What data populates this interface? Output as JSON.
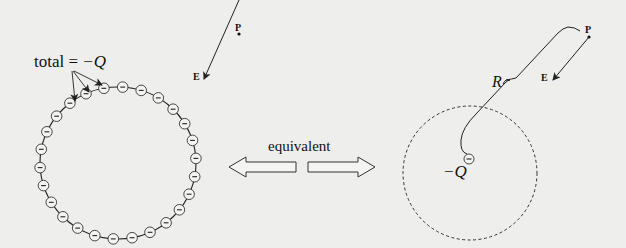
{
  "left_panel": {
    "total_label": "total = ",
    "total_value": "−Q",
    "point_label": "P",
    "field_label": "E",
    "charge_symbol": "−",
    "charge_count": 26
  },
  "middle": {
    "equivalent_label": "equivalent"
  },
  "right_panel": {
    "point_label": "P",
    "field_label": "E",
    "distance_label": "R",
    "charge_label": "−Q",
    "charge_symbol": "−"
  },
  "colors": {
    "background": "#eeeeec",
    "ink": "#222222"
  }
}
